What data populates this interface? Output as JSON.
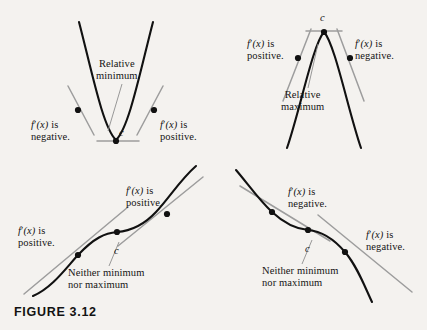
{
  "figure": {
    "caption": "FIGURE 3.12",
    "background_color": "#f4f2ef",
    "curve_color": "#111111",
    "tangent_color": "#9d9d9d",
    "point_color": "#111111"
  },
  "panels": [
    {
      "id": "relative-minimum",
      "shape": "upward-parabola",
      "critical_label": "c",
      "annotation": {
        "line1": "Relative",
        "line2": "minimum"
      },
      "left_label": {
        "line1_fn": "f",
        "line1_prime": "′",
        "line1_var": "(x)",
        "line1_tail": " is",
        "line2": "negative."
      },
      "right_label": {
        "line1_fn": "f",
        "line1_prime": "′",
        "line1_var": "(x)",
        "line1_tail": " is",
        "line2": "positive."
      }
    },
    {
      "id": "relative-maximum",
      "shape": "downward-parabola",
      "critical_label": "c",
      "annotation": {
        "line1": "Relative",
        "line2": "maximum"
      },
      "left_label": {
        "line1_fn": "f",
        "line1_prime": "′",
        "line1_var": "(x)",
        "line1_tail": " is",
        "line2": "positive."
      },
      "right_label": {
        "line1_fn": "f",
        "line1_prime": "′",
        "line1_var": "(x)",
        "line1_tail": " is",
        "line2": "negative."
      }
    },
    {
      "id": "increasing-inflection",
      "shape": "increasing-cubic",
      "critical_label": "c",
      "annotation": {
        "line1": "Neither minimum",
        "line2": "nor maximum"
      },
      "left_label": {
        "line1_fn": "f",
        "line1_prime": "′",
        "line1_var": "(x)",
        "line1_tail": " is",
        "line2": "positive."
      },
      "right_label": {
        "line1_fn": "f",
        "line1_prime": "′",
        "line1_var": "(x)",
        "line1_tail": " is",
        "line2": "positive."
      }
    },
    {
      "id": "decreasing-inflection",
      "shape": "decreasing-cubic",
      "critical_label": "c",
      "annotation": {
        "line1": "Neither minimum",
        "line2": "nor maximum"
      },
      "left_label": {
        "line1_fn": "f",
        "line1_prime": "′",
        "line1_var": "(x)",
        "line1_tail": " is",
        "line2": "negative."
      },
      "right_label": {
        "line1_fn": "f",
        "line1_prime": "′",
        "line1_var": "(x)",
        "line1_tail": " is",
        "line2": "negative."
      }
    }
  ]
}
